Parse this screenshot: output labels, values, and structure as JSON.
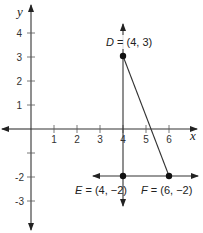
{
  "diagram": {
    "type": "coordinate-plane",
    "axes": {
      "x_label": "x",
      "y_label": "y",
      "x_ticks": [
        "1",
        "2",
        "3",
        "4",
        "5",
        "6"
      ],
      "y_ticks_positive": [
        "1",
        "2",
        "3",
        "4"
      ],
      "y_ticks_negative": [
        "",
        "-2",
        "-3"
      ]
    },
    "points": [
      {
        "letter": "D",
        "eq": " = ",
        "coords": "(4, 3)",
        "x": 4,
        "y": 3
      },
      {
        "letter": "E",
        "eq": " = ",
        "coords": "(4, −2)",
        "x": 4,
        "y": -2
      },
      {
        "letter": "F",
        "eq": " = ",
        "coords": "(6, −2)",
        "x": 6,
        "y": -2
      }
    ],
    "segments": [
      {
        "from": "D",
        "to": "F",
        "kind": "segment"
      },
      {
        "through": "x = 4",
        "kind": "vertical line"
      },
      {
        "through": "y = -2",
        "kind": "horizontal line"
      }
    ],
    "colors": {
      "line": "#333333",
      "point": "#111111"
    }
  }
}
